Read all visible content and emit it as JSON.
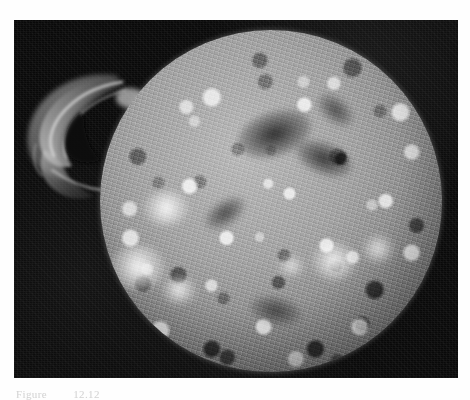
{
  "document": {
    "type": "textbook-figure-page",
    "background_color": "#fefefe"
  },
  "figure": {
    "frame": {
      "background_color": "#0a0a0a",
      "x": 14,
      "y": 20,
      "width": 444,
      "height": 358
    },
    "image": {
      "subject": "sun-photograph",
      "description": "Grayscale astronomical photograph of the Sun showing a mottled chromosphere with bright plage regions, dark filaments, and a large solar prominence erupting from the upper-left limb",
      "color_mode": "grayscale",
      "disk": {
        "center_x": 257,
        "center_y": 201,
        "radius": 171,
        "surface_texture": "mottled granulation",
        "highlight_color": "#ffffff",
        "midtone_color": "#9a9a9a",
        "shadow_color": "#3e3e3e"
      },
      "sky_color": "#090909",
      "features": [
        {
          "name": "solar-prominence",
          "location": "upper-left limb",
          "kind": "eruptive arc"
        },
        {
          "name": "plage-region",
          "location": "left-center disk",
          "kind": "bright active region"
        },
        {
          "name": "plage-region",
          "location": "lower-left limb",
          "kind": "bright active region"
        },
        {
          "name": "plage-region",
          "location": "lower-right disk",
          "kind": "bright active region"
        },
        {
          "name": "filament",
          "location": "upper-center disk",
          "kind": "dark filament"
        },
        {
          "name": "filament",
          "location": "center-right disk",
          "kind": "dark filament"
        }
      ]
    }
  },
  "caption": {
    "label": "Figure",
    "number": "12.12"
  }
}
